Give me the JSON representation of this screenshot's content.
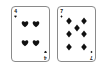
{
  "scene": {
    "title": "Two playing cards on a white background",
    "background_color": "#ffffff",
    "card_face_color": "#ffffff",
    "card_border_color": "#8a8a8a",
    "pip_color": "#111111"
  },
  "cards": [
    {
      "id": "four-of-hearts",
      "rank": "4",
      "suit": "hearts",
      "suit_symbol": "♥",
      "pip_count": 4,
      "pip_color": "#111111",
      "pip_positions": [
        {
          "x": 28,
          "y": 22
        },
        {
          "x": 72,
          "y": 22
        },
        {
          "x": 28,
          "y": 74
        },
        {
          "x": 72,
          "y": 74
        }
      ]
    },
    {
      "id": "seven-of-diamonds",
      "rank": "7",
      "suit": "diamonds",
      "suit_symbol": "♦",
      "pip_count": 7,
      "pip_color": "#111111",
      "pip_positions": [
        {
          "x": 24,
          "y": 14
        },
        {
          "x": 76,
          "y": 14
        },
        {
          "x": 50,
          "y": 34
        },
        {
          "x": 24,
          "y": 50
        },
        {
          "x": 76,
          "y": 50
        },
        {
          "x": 24,
          "y": 86
        },
        {
          "x": 76,
          "y": 86
        }
      ]
    }
  ]
}
